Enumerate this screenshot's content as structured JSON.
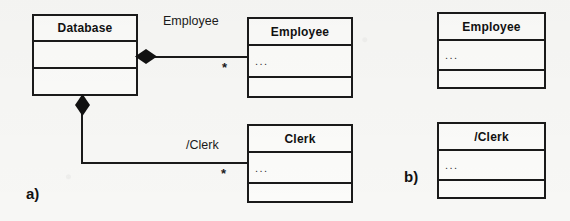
{
  "diagram": {
    "type": "uml-class-diagram",
    "panels": [
      {
        "id": "a",
        "label": "a)",
        "classes": [
          {
            "name": "Database",
            "attributes": "",
            "operations": ""
          },
          {
            "name": "Employee",
            "attributes": "...",
            "operations": ""
          },
          {
            "name": "Clerk",
            "attributes": "...",
            "operations": ""
          }
        ],
        "associations": [
          {
            "from": "Database",
            "to": "Employee",
            "kind": "composition",
            "role_label": "Employee",
            "multiplicity": "*"
          },
          {
            "from": "Database",
            "to": "Clerk",
            "kind": "composition",
            "role_label": "/Clerk",
            "multiplicity": "*"
          }
        ]
      },
      {
        "id": "b",
        "label": "b)",
        "classes": [
          {
            "name": "Employee",
            "attributes": "...",
            "operations": ""
          },
          {
            "name": "/Clerk",
            "attributes": "...",
            "operations": ""
          }
        ],
        "associations": []
      }
    ]
  },
  "colors": {
    "line": "#1a1a1a",
    "box_fill": "#fbfbf9",
    "background": "#f7f7f5",
    "text": "#111111"
  }
}
